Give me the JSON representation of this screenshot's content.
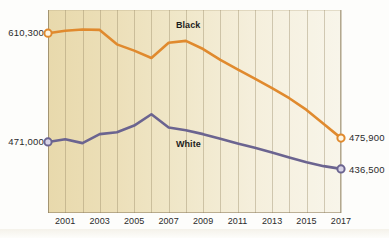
{
  "chart_data": {
    "type": "line",
    "title": "",
    "xlabel": "",
    "ylabel": "",
    "x": [
      2000,
      2001,
      2002,
      2003,
      2004,
      2005,
      2006,
      2007,
      2008,
      2009,
      2010,
      2011,
      2012,
      2013,
      2014,
      2015,
      2016,
      2017
    ],
    "xlim": [
      2000,
      2017
    ],
    "ylim": [
      380000,
      640000
    ],
    "grid": true,
    "legend_position": "inline-annotation",
    "series": [
      {
        "name": "Black",
        "color": "#e08a2e",
        "values": [
          610300,
          613500,
          615000,
          614500,
          596000,
          588000,
          578500,
          598000,
          600500,
          590000,
          576000,
          564000,
          552000,
          540000,
          527000,
          512000,
          494000,
          475900
        ],
        "start_label": "610,300",
        "end_label": "475,900",
        "marker_start": true,
        "marker_end": true
      },
      {
        "name": "White",
        "color": "#6b6490",
        "values": [
          471000,
          474500,
          469500,
          481000,
          483500,
          492000,
          506500,
          489500,
          486000,
          481000,
          475000,
          469000,
          463500,
          457500,
          451000,
          445000,
          440000,
          436500
        ],
        "start_label": "471,000",
        "end_label": "436,500",
        "marker_start": true,
        "marker_end": true
      }
    ],
    "axis_labels_left": [
      "610,300",
      "471,000"
    ],
    "axis_labels_right": [
      "475,900",
      "436,500"
    ],
    "xtick_labels": [
      "2001",
      "2003",
      "2005",
      "2007",
      "2009",
      "2011",
      "2013",
      "2015",
      "2017"
    ],
    "xtick_values": [
      2001,
      2003,
      2005,
      2007,
      2009,
      2011,
      2013,
      2015,
      2017
    ],
    "annotations": [
      {
        "text": "Black",
        "series": "Black"
      },
      {
        "text": "White",
        "series": "White"
      }
    ]
  },
  "style": {
    "plot_bg_left": "#e8d9ac",
    "plot_bg_right": "#f8f5ea",
    "gridline_color": "#968764"
  }
}
